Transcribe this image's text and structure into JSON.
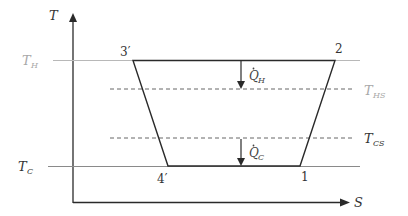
{
  "diagram": {
    "type": "T-S diagram",
    "axes": {
      "y_label": "T",
      "x_label": "S"
    },
    "temperature_levels": {
      "T_H": {
        "label_main": "T",
        "label_sub": "H",
        "color": "#a0a0a0"
      },
      "T_HS": {
        "label_main": "T",
        "label_sub": "HS",
        "color": "#a0a0a0"
      },
      "T_CS": {
        "label_main": "T",
        "label_sub": "CS",
        "color": "#333333"
      },
      "T_C": {
        "label_main": "T",
        "label_sub": "C",
        "color": "#333333"
      }
    },
    "points": {
      "p3": "3′",
      "p2": "2",
      "p4": "4′",
      "p1": "1"
    },
    "heat_flows": {
      "QH": {
        "label_main": "Q",
        "label_sub": "H"
      },
      "QC": {
        "label_main": "Q",
        "label_sub": "C"
      }
    },
    "colors": {
      "line": "#2a2a2a",
      "light_line": "#b0b0b0",
      "dashed": "#555555"
    }
  }
}
